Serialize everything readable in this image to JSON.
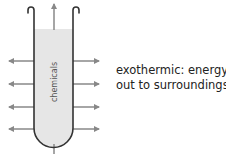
{
  "diagram": {
    "tube_label": "chemicals",
    "caption": {
      "line1": "exothermic: energy",
      "line2": "out to surroundings"
    },
    "colors": {
      "tube_outline": "#333333",
      "tube_fill": "#e6e6e6",
      "arrow": "#888888",
      "text": "#222222"
    },
    "arrows": {
      "left_count": 4,
      "right_count": 4,
      "top_count": 1,
      "bottom_count": 1,
      "direction": "outward"
    }
  }
}
